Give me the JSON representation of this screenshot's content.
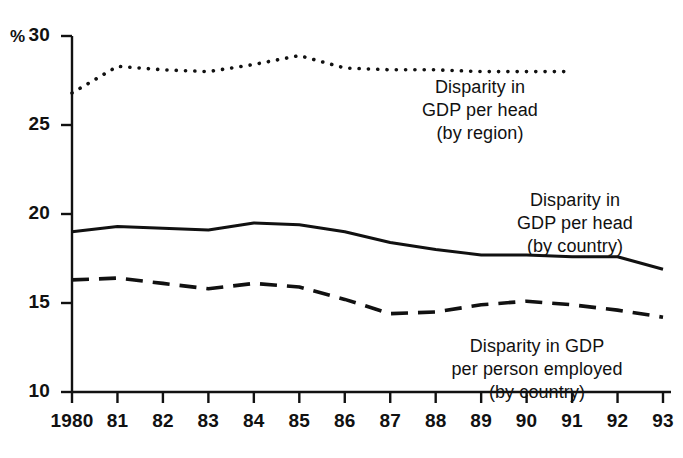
{
  "chart_data": {
    "type": "line",
    "title": "",
    "xlabel": "",
    "ylabel": "%",
    "ylim": [
      10,
      30
    ],
    "yticks": [
      10,
      15,
      20,
      25,
      30
    ],
    "grid": false,
    "legend_position": "inline-annotations",
    "x": [
      1980,
      1981,
      1982,
      1983,
      1984,
      1985,
      1986,
      1987,
      1988,
      1989,
      1990,
      1991,
      1992,
      1993
    ],
    "categories": [
      "1980",
      "81",
      "82",
      "83",
      "84",
      "85",
      "86",
      "87",
      "88",
      "89",
      "90",
      "91",
      "92",
      "93"
    ],
    "series": [
      {
        "name": "Disparity in GDP per head (by region)",
        "style": "dotted",
        "values": [
          26.8,
          28.3,
          28.1,
          28.0,
          28.4,
          28.9,
          28.2,
          28.1,
          28.1,
          28.0,
          28.0,
          28.0,
          null,
          null
        ]
      },
      {
        "name": "Disparity in GDP per head (by country)",
        "style": "solid",
        "values": [
          19.0,
          19.3,
          19.2,
          19.1,
          19.5,
          19.4,
          19.0,
          18.4,
          18.0,
          17.7,
          17.7,
          17.6,
          17.6,
          16.9
        ]
      },
      {
        "name": "Disparity in GDP per person employed (by country)",
        "style": "dashed",
        "values": [
          16.3,
          16.4,
          16.1,
          15.8,
          16.1,
          15.9,
          15.2,
          14.4,
          14.5,
          14.9,
          15.1,
          14.9,
          14.6,
          14.2
        ]
      }
    ],
    "annotations": [
      {
        "id": "region-label",
        "lines": [
          "Disparity in",
          "GDP per head",
          "(by region)"
        ],
        "target_series": "Disparity in GDP per head (by region)"
      },
      {
        "id": "country-head-label",
        "lines": [
          "Disparity in",
          "GDP per head",
          "(by country)"
        ],
        "target_series": "Disparity in GDP per head (by country)"
      },
      {
        "id": "country-employed-label",
        "lines": [
          "Disparity in GDP",
          "per person employed",
          "(by country)"
        ],
        "target_series": "Disparity in GDP per person employed (by country)"
      }
    ],
    "colors": {
      "axis": "#111111",
      "series_region": "#111111",
      "series_country_head": "#111111",
      "series_country_employed": "#111111",
      "background": "#ffffff"
    }
  },
  "axis": {
    "unit_label": "%",
    "y_tick_labels": [
      "30",
      "25",
      "20",
      "15",
      "10"
    ],
    "x_tick_labels": [
      "1980",
      "81",
      "82",
      "83",
      "84",
      "85",
      "86",
      "87",
      "88",
      "89",
      "90",
      "91",
      "92",
      "93"
    ]
  },
  "annotations": {
    "region": {
      "line1": "Disparity in",
      "line2": "GDP per head",
      "line3": "(by region)"
    },
    "country_head": {
      "line1": "Disparity in",
      "line2": "GDP per head",
      "line3": "(by country)"
    },
    "country_employed": {
      "line1": "Disparity in GDP",
      "line2": "per person employed",
      "line3": "(by country)"
    }
  }
}
